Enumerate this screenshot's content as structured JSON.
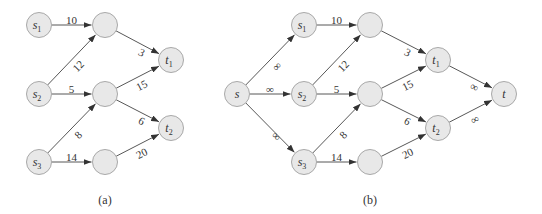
{
  "diagrams": [
    {
      "id": "a",
      "caption": "(a)",
      "nodes": [
        {
          "id": "s1",
          "label": "s",
          "sub": "1",
          "x": 39,
          "y": 25
        },
        {
          "id": "s2",
          "label": "s",
          "sub": "2",
          "x": 39,
          "y": 94
        },
        {
          "id": "s3",
          "label": "s",
          "sub": "3",
          "x": 39,
          "y": 162
        },
        {
          "id": "m1",
          "label": "",
          "sub": "",
          "x": 105,
          "y": 25
        },
        {
          "id": "m2",
          "label": "",
          "sub": "",
          "x": 105,
          "y": 94
        },
        {
          "id": "m3",
          "label": "",
          "sub": "",
          "x": 105,
          "y": 162
        },
        {
          "id": "t1",
          "label": "t",
          "sub": "1",
          "x": 171,
          "y": 60
        },
        {
          "id": "t2",
          "label": "t",
          "sub": "2",
          "x": 171,
          "y": 128
        }
      ],
      "edges": [
        {
          "from": "s1",
          "to": "m1",
          "label": "10"
        },
        {
          "from": "s2",
          "to": "m1",
          "label": "12"
        },
        {
          "from": "s2",
          "to": "m2",
          "label": "5"
        },
        {
          "from": "s3",
          "to": "m2",
          "label": "8"
        },
        {
          "from": "s3",
          "to": "m3",
          "label": "14"
        },
        {
          "from": "m1",
          "to": "t1",
          "label": "3"
        },
        {
          "from": "m2",
          "to": "t1",
          "label": "15"
        },
        {
          "from": "m2",
          "to": "t2",
          "label": "6"
        },
        {
          "from": "m3",
          "to": "t2",
          "label": "20"
        }
      ]
    },
    {
      "id": "b",
      "caption": "(b)",
      "nodes": [
        {
          "id": "s",
          "label": "s",
          "sub": "",
          "x": 237,
          "y": 94
        },
        {
          "id": "s1",
          "label": "s",
          "sub": "1",
          "x": 304,
          "y": 25
        },
        {
          "id": "s2",
          "label": "s",
          "sub": "2",
          "x": 304,
          "y": 94
        },
        {
          "id": "s3",
          "label": "s",
          "sub": "3",
          "x": 304,
          "y": 162
        },
        {
          "id": "m1",
          "label": "",
          "sub": "",
          "x": 370,
          "y": 25
        },
        {
          "id": "m2",
          "label": "",
          "sub": "",
          "x": 370,
          "y": 94
        },
        {
          "id": "m3",
          "label": "",
          "sub": "",
          "x": 370,
          "y": 162
        },
        {
          "id": "t1",
          "label": "t",
          "sub": "1",
          "x": 438,
          "y": 60
        },
        {
          "id": "t2",
          "label": "t",
          "sub": "2",
          "x": 438,
          "y": 128
        },
        {
          "id": "t",
          "label": "t",
          "sub": "",
          "x": 504,
          "y": 94
        }
      ],
      "edges": [
        {
          "from": "s",
          "to": "s1",
          "label": "∞"
        },
        {
          "from": "s",
          "to": "s2",
          "label": "∞"
        },
        {
          "from": "s",
          "to": "s3",
          "label": "∞"
        },
        {
          "from": "s1",
          "to": "m1",
          "label": "10"
        },
        {
          "from": "s2",
          "to": "m1",
          "label": "12"
        },
        {
          "from": "s2",
          "to": "m2",
          "label": "5"
        },
        {
          "from": "s3",
          "to": "m2",
          "label": "8"
        },
        {
          "from": "s3",
          "to": "m3",
          "label": "14"
        },
        {
          "from": "m1",
          "to": "t1",
          "label": "3"
        },
        {
          "from": "m2",
          "to": "t1",
          "label": "15"
        },
        {
          "from": "m2",
          "to": "t2",
          "label": "6"
        },
        {
          "from": "m3",
          "to": "t2",
          "label": "20"
        },
        {
          "from": "t1",
          "to": "t",
          "label": "∞"
        },
        {
          "from": "t2",
          "to": "t",
          "label": "∞"
        }
      ]
    }
  ],
  "style": {
    "node_fill": "#e8e8e8",
    "node_stroke": "#a8a8a8",
    "edge_color": "#444444"
  }
}
